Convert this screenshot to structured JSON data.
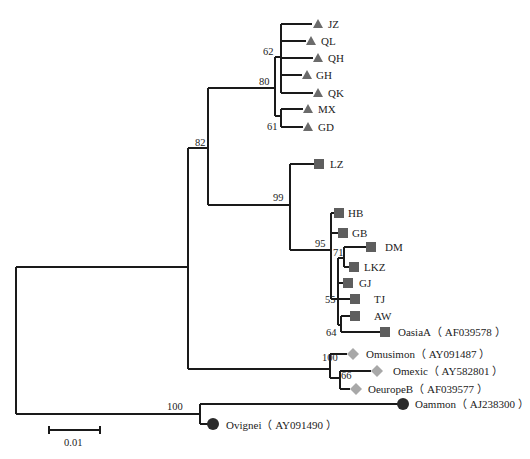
{
  "figure": {
    "type": "phylogenetic-tree",
    "scale_bar": {
      "label": "0.01"
    },
    "marker_colors": {
      "triangle": "#6b6b6b",
      "square": "#5e5e5e",
      "diamond": "#a8a8a8",
      "circle": "#2a2a2a"
    }
  },
  "taxa": [
    {
      "id": "JZ",
      "label": "JZ",
      "marker": "triangle"
    },
    {
      "id": "QL",
      "label": "QL",
      "marker": "triangle"
    },
    {
      "id": "QH",
      "label": "QH",
      "marker": "triangle"
    },
    {
      "id": "GH",
      "label": "GH",
      "marker": "triangle"
    },
    {
      "id": "QK",
      "label": "QK",
      "marker": "triangle"
    },
    {
      "id": "MX",
      "label": "MX",
      "marker": "triangle"
    },
    {
      "id": "GD",
      "label": "GD",
      "marker": "triangle"
    },
    {
      "id": "LZ",
      "label": "LZ",
      "marker": "square"
    },
    {
      "id": "HB",
      "label": "HB",
      "marker": "square"
    },
    {
      "id": "GB",
      "label": "GB",
      "marker": "square"
    },
    {
      "id": "DM",
      "label": "DM",
      "marker": "square"
    },
    {
      "id": "LKZ",
      "label": "LKZ",
      "marker": "square"
    },
    {
      "id": "GJ",
      "label": "GJ",
      "marker": "square"
    },
    {
      "id": "TJ",
      "label": "TJ",
      "marker": "square"
    },
    {
      "id": "AW",
      "label": "AW",
      "marker": "square"
    },
    {
      "id": "OasiaA",
      "label": "OasiaA（ AF039578 ）",
      "marker": "square"
    },
    {
      "id": "Omusimon",
      "label": "Omusimon（ AY091487 ）",
      "marker": "diamond"
    },
    {
      "id": "Omexic",
      "label": "Omexic（ AY582801 ）",
      "marker": "diamond"
    },
    {
      "id": "OeuropeB",
      "label": "OeuropeB（ AF039577 ）",
      "marker": "diamond"
    },
    {
      "id": "Oammon",
      "label": "Oammon（ AJ238300 ）",
      "marker": "circle"
    },
    {
      "id": "Ovignei",
      "label": "Ovignei（ AY091490 ）",
      "marker": "circle"
    }
  ],
  "bootstrap": {
    "n62": "62",
    "n80": "80",
    "n61": "61",
    "n82": "82",
    "n99": "99",
    "n95": "95",
    "n71": "71",
    "n55": "55",
    "n64": "64",
    "n100a": "100",
    "n66": "66",
    "n100b": "100"
  }
}
